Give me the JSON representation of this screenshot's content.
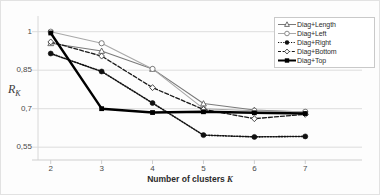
{
  "chart_data": {
    "type": "line",
    "title": "",
    "xlabel": "Number of clusters K",
    "ylabel": "R_K",
    "x": [
      2,
      3,
      4,
      5,
      6,
      7
    ],
    "xticklabels": [
      "2",
      "3",
      "4",
      "5",
      "6",
      "7"
    ],
    "yticklabels": [
      "1",
      "0,85",
      "0,7",
      "0,55"
    ],
    "ytickvalues": [
      1,
      0.85,
      0.7,
      0.55
    ],
    "ylim": [
      0.5,
      1.03
    ],
    "xlim": [
      1.75,
      7.25
    ],
    "grid": "horizontal",
    "legend_position": "top-right",
    "series": [
      {
        "name": "Diag+Length",
        "values": [
          0.955,
          0.925,
          0.855,
          0.72,
          0.695,
          0.687
        ],
        "color": "#7a7a7a",
        "line_style": "solid",
        "marker": "triangle-open"
      },
      {
        "name": "Diag+Left",
        "values": [
          1.0,
          0.955,
          0.855,
          0.7,
          0.692,
          0.688
        ],
        "color": "#a8a8a8",
        "line_style": "solid",
        "marker": "circle-open"
      },
      {
        "name": "Diag+Right",
        "values": [
          0.915,
          0.845,
          0.722,
          0.597,
          0.59,
          0.592
        ],
        "color": "#111111",
        "line_style": "dotted",
        "marker": "circle-filled"
      },
      {
        "name": "Diag+Bottom",
        "values": [
          0.96,
          0.905,
          0.782,
          0.697,
          0.661,
          0.678
        ],
        "color": "#1a1a1a",
        "line_style": "dashed",
        "marker": "diamond-open"
      },
      {
        "name": "Diag+Top",
        "values": [
          0.995,
          0.7,
          0.685,
          0.688,
          0.684,
          0.681
        ],
        "color": "#000000",
        "line_style": "solid-thick",
        "marker": "square-filled"
      }
    ]
  },
  "legend": {
    "items": [
      {
        "label": "Diag+Length"
      },
      {
        "label": "Diag+Left"
      },
      {
        "label": "Diag+Right"
      },
      {
        "label": "Diag+Bottom"
      },
      {
        "label": "Diag+Top"
      }
    ]
  },
  "axes": {
    "y_title_main": "R",
    "y_title_sub": "K",
    "x_title_text": "Number of clusters",
    "x_title_var": "K"
  }
}
